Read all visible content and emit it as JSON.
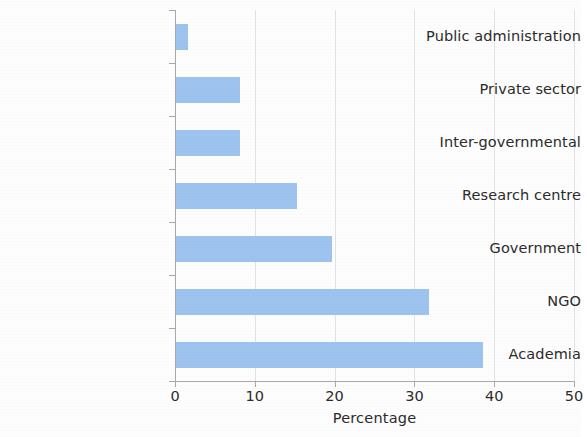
{
  "chart_data": {
    "type": "bar",
    "orientation": "horizontal",
    "title": "",
    "xlabel": "Percentage",
    "ylabel": "",
    "xlim": [
      0,
      50
    ],
    "xticks": [
      0,
      10,
      20,
      30,
      40,
      50
    ],
    "xtick_labels": [
      "0",
      "10",
      "20",
      "30",
      "40",
      "50"
    ],
    "grid": "vertical",
    "legend": "none",
    "bar_color": "#9dc3ef",
    "categories": [
      "Public administration",
      "Private sector",
      "Inter-governmental",
      "Research centre",
      "Government",
      "NGO",
      "Academia"
    ],
    "values": [
      1.6,
      8.1,
      8.1,
      15.3,
      19.7,
      31.8,
      38.6
    ],
    "series": [
      {
        "name": "Percentage",
        "values": [
          1.6,
          8.1,
          8.1,
          15.3,
          19.7,
          31.8,
          38.6
        ]
      }
    ]
  },
  "axis": {
    "x_title": "Percentage"
  }
}
